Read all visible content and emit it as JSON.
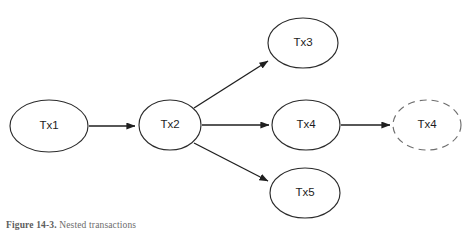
{
  "figure": {
    "background_color": "#ffffff",
    "caption_prefix": "Figure 14-3.",
    "caption_text": "Nested transactions",
    "caption_full": "Figure 14-3. Nested transactions"
  },
  "colors": {
    "node_stroke": "#2b2b2b",
    "node_fill": "#ffffff",
    "dashed_node_stroke": "#6f6f6f",
    "edge_stroke": "#1f1f1f",
    "label_color": "#1d1d1d",
    "caption_color": "#6b6b6b"
  },
  "diagram": {
    "type": "directed-graph",
    "nodes": [
      {
        "id": "tx1",
        "label": "Tx1",
        "style": "solid",
        "cx": 49,
        "cy": 126,
        "rx": 39,
        "ry": 26
      },
      {
        "id": "tx2",
        "label": "Tx2",
        "style": "solid",
        "cx": 170,
        "cy": 125,
        "rx": 31,
        "ry": 25
      },
      {
        "id": "tx3",
        "label": "Tx3",
        "style": "solid",
        "cx": 303,
        "cy": 43,
        "rx": 35,
        "ry": 25
      },
      {
        "id": "tx4",
        "label": "Tx4",
        "style": "solid",
        "cx": 306,
        "cy": 125,
        "rx": 34,
        "ry": 25
      },
      {
        "id": "tx5",
        "label": "Tx5",
        "style": "solid",
        "cx": 305,
        "cy": 193,
        "rx": 35,
        "ry": 25
      },
      {
        "id": "tx4-dashed",
        "label": "Tx4",
        "style": "dashed",
        "cx": 427,
        "cy": 125,
        "rx": 34,
        "ry": 25
      }
    ],
    "edges": [
      {
        "id": "edge-tx1-tx2",
        "from": "Tx1",
        "to": "Tx2",
        "arrow": "solid-filled"
      },
      {
        "id": "edge-tx2-tx3",
        "from": "Tx2",
        "to": "Tx3",
        "arrow": "solid-filled"
      },
      {
        "id": "edge-tx2-tx4",
        "from": "Tx2",
        "to": "Tx4",
        "arrow": "solid-filled"
      },
      {
        "id": "edge-tx2-tx5",
        "from": "Tx2",
        "to": "Tx5",
        "arrow": "solid-filled"
      },
      {
        "id": "edge-tx4-tx4d",
        "from": "Tx4",
        "to": "Tx4",
        "arrow": "solid-filled"
      }
    ]
  }
}
